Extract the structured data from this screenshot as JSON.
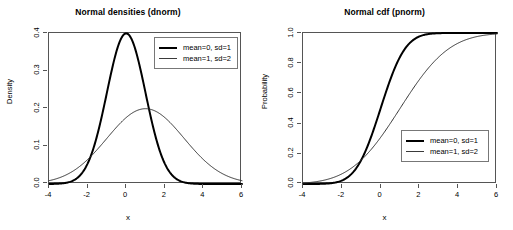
{
  "figure": {
    "background": "#ffffff",
    "foreground": "#000000",
    "panel_count": 2
  },
  "panels": [
    {
      "title": "Normal densities (dnorm)",
      "xlabel": "x",
      "ylabel": "Density",
      "xticks": [
        "-4",
        "-2",
        "0",
        "2",
        "4",
        "6"
      ],
      "yticks": [
        "0.0",
        "0.1",
        "0.2",
        "0.3",
        "0.4"
      ],
      "legend": {
        "position": "top-right",
        "entries": [
          {
            "label": "mean=0, sd=1",
            "style": "thick"
          },
          {
            "label": "mean=1, sd=2",
            "style": "thin"
          }
        ]
      }
    },
    {
      "title": "Normal cdf (pnorm)",
      "xlabel": "x",
      "ylabel": "Probability",
      "xticks": [
        "-4",
        "-2",
        "0",
        "2",
        "4",
        "6"
      ],
      "yticks": [
        "0.0",
        "0.2",
        "0.4",
        "0.6",
        "0.8",
        "1.0"
      ],
      "legend": {
        "position": "bottom-right",
        "entries": [
          {
            "label": "mean=0, sd=1",
            "style": "thick"
          },
          {
            "label": "mean=1, sd=2",
            "style": "thin"
          }
        ]
      }
    }
  ],
  "chart_data": [
    {
      "type": "line",
      "title": "Normal densities (dnorm)",
      "xlabel": "x",
      "ylabel": "Density",
      "xlim": [
        -4,
        6
      ],
      "ylim": [
        0,
        0.4
      ],
      "xticks": [
        -4,
        -2,
        0,
        2,
        4,
        6
      ],
      "yticks": [
        0.0,
        0.1,
        0.2,
        0.3,
        0.4
      ],
      "grid": false,
      "legend_position": "top-right",
      "series": [
        {
          "name": "mean=0, sd=1",
          "line_width": 2,
          "color": "#000000",
          "x": [
            -4,
            -3.5,
            -3,
            -2.5,
            -2,
            -1.5,
            -1,
            -0.5,
            0,
            0.5,
            1,
            1.5,
            2,
            2.5,
            3,
            3.5,
            4,
            4.5,
            5,
            5.5,
            6
          ],
          "y": [
            0.0001,
            0.0009,
            0.0044,
            0.0175,
            0.054,
            0.1295,
            0.242,
            0.3521,
            0.3989,
            0.3521,
            0.242,
            0.1295,
            0.054,
            0.0175,
            0.0044,
            0.0009,
            0.0001,
            0.0,
            0.0,
            0.0,
            0.0
          ]
        },
        {
          "name": "mean=1, sd=2",
          "line_width": 1,
          "color": "#333333",
          "x": [
            -4,
            -3.5,
            -3,
            -2.5,
            -2,
            -1.5,
            -1,
            -0.5,
            0,
            0.5,
            1,
            1.5,
            2,
            2.5,
            3,
            3.5,
            4,
            4.5,
            5,
            5.5,
            6
          ],
          "y": [
            0.0088,
            0.013,
            0.0183,
            0.0248,
            0.0324,
            0.041,
            0.05,
            0.0588,
            0.0666,
            0.0727,
            0.0761,
            0.0766,
            0.0752,
            0.0727,
            0.0666,
            0.0588,
            0.05,
            0.041,
            0.0324,
            0.0248,
            0.0183
          ]
        }
      ],
      "note": "second series scaled by dnorm(x,1,2); peak 0.1995 at x=1"
    },
    {
      "type": "line",
      "title": "Normal cdf (pnorm)",
      "xlabel": "x",
      "ylabel": "Probability",
      "xlim": [
        -4,
        6
      ],
      "ylim": [
        0,
        1.0
      ],
      "xticks": [
        -4,
        -2,
        0,
        2,
        4,
        6
      ],
      "yticks": [
        0.0,
        0.2,
        0.4,
        0.6,
        0.8,
        1.0
      ],
      "grid": false,
      "legend_position": "bottom-right",
      "series": [
        {
          "name": "mean=0, sd=1",
          "line_width": 2,
          "color": "#000000",
          "x": [
            -4,
            -3.5,
            -3,
            -2.5,
            -2,
            -1.5,
            -1,
            -0.5,
            0,
            0.5,
            1,
            1.5,
            2,
            2.5,
            3,
            3.5,
            4,
            4.5,
            5,
            5.5,
            6
          ],
          "y": [
            3e-05,
            0.0002,
            0.0013,
            0.0062,
            0.0228,
            0.0668,
            0.1587,
            0.3085,
            0.5,
            0.6915,
            0.8413,
            0.9332,
            0.9772,
            0.9938,
            0.9987,
            0.9998,
            1.0,
            1.0,
            1.0,
            1.0,
            1.0
          ]
        },
        {
          "name": "mean=1, sd=2",
          "line_width": 1,
          "color": "#333333",
          "x": [
            -4,
            -3.5,
            -3,
            -2.5,
            -2,
            -1.5,
            -1,
            -0.5,
            0,
            0.5,
            1,
            1.5,
            2,
            2.5,
            3,
            3.5,
            4,
            4.5,
            5,
            5.5,
            6
          ],
          "y": [
            0.0062,
            0.0122,
            0.0228,
            0.0401,
            0.0668,
            0.1056,
            0.1587,
            0.2266,
            0.3085,
            0.4013,
            0.5,
            0.5987,
            0.6915,
            0.7734,
            0.8413,
            0.8944,
            0.9332,
            0.9599,
            0.9772,
            0.9878,
            0.9938
          ]
        }
      ]
    }
  ]
}
